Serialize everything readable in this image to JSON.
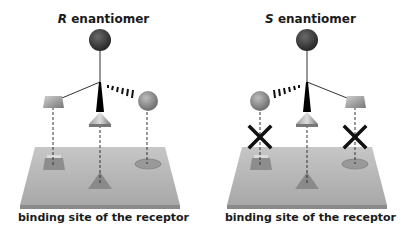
{
  "panels": [
    {
      "id": "r",
      "title_letter": "R",
      "title_rest": " enantiomer",
      "caption": "binding site of the receptor",
      "binding": [
        "match",
        "match",
        "match"
      ]
    },
    {
      "id": "s",
      "title_letter": "S",
      "title_rest": " enantiomer",
      "caption": "binding site of the receptor",
      "binding": [
        "mismatch",
        "match",
        "mismatch"
      ]
    }
  ],
  "colors": {
    "background": "#ffffff",
    "top_sphere": "#3a3a3a",
    "side_sphere": "#8a8a8a",
    "plate": "#b5b5b5",
    "text": "#1a1a1a",
    "mismatch_x": "#111111"
  }
}
